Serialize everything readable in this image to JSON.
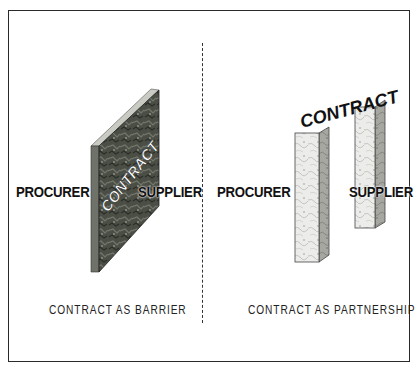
{
  "diagram": {
    "left_panel": {
      "procurer_label": "PROCURER",
      "supplier_label": "SUPPLIER",
      "contract_label": "CONTRACT",
      "caption": "CONTRACT AS BARRIER",
      "contract_shape": "brick-wall"
    },
    "right_panel": {
      "procurer_label": "PROCURER",
      "supplier_label": "SUPPLIER",
      "contract_label": "CONTRACT",
      "caption": "CONTRACT AS PARTNERSHIP",
      "contract_shape": "two-pillars"
    },
    "colors": {
      "frame": "#2a2a2a",
      "wall_dark": "#3d4038",
      "wall_mid": "#6a6e64",
      "pillar_light": "#e8e8e4",
      "pillar_side": "#a9a9a4"
    }
  }
}
